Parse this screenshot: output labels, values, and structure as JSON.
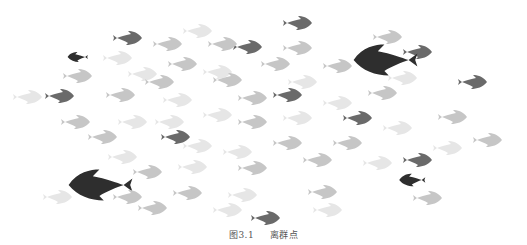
{
  "figure": {
    "caption_number": "图3.1",
    "caption_title": "离群点"
  },
  "colors": {
    "light": "#e6e6e6",
    "medium": "#c6c6c6",
    "dark": "#6a6a6a",
    "outlier": "#2e2e2e"
  },
  "fish": [
    {
      "x": 300,
      "y": 23,
      "s": 1,
      "c": "dark",
      "d": 1
    },
    {
      "x": 130,
      "y": 38,
      "s": 1,
      "c": "dark",
      "d": 1
    },
    {
      "x": 200,
      "y": 31,
      "s": 1,
      "c": "light",
      "d": 1
    },
    {
      "x": 390,
      "y": 37,
      "s": 1,
      "c": "medium",
      "d": 1
    },
    {
      "x": 250,
      "y": 47,
      "s": 1,
      "c": "dark",
      "d": 1
    },
    {
      "x": 225,
      "y": 44,
      "s": 1,
      "c": "medium",
      "d": 1
    },
    {
      "x": 300,
      "y": 48,
      "s": 1,
      "c": "medium",
      "d": 1
    },
    {
      "x": 420,
      "y": 52,
      "s": 1,
      "c": "dark",
      "d": 1
    },
    {
      "x": 76,
      "y": 57,
      "s": 0.7,
      "c": "outlier",
      "d": -1
    },
    {
      "x": 170,
      "y": 44,
      "s": 1,
      "c": "medium",
      "d": 1
    },
    {
      "x": 380,
      "y": 60,
      "s": 2.2,
      "c": "outlier",
      "d": -1
    },
    {
      "x": 120,
      "y": 58,
      "s": 1,
      "c": "light",
      "d": 1
    },
    {
      "x": 185,
      "y": 64,
      "s": 1,
      "c": "medium",
      "d": 1
    },
    {
      "x": 278,
      "y": 64,
      "s": 1,
      "c": "medium",
      "d": 1
    },
    {
      "x": 340,
      "y": 66,
      "s": 1,
      "c": "medium",
      "d": 1
    },
    {
      "x": 80,
      "y": 76,
      "s": 1,
      "c": "medium",
      "d": 1
    },
    {
      "x": 145,
      "y": 74,
      "s": 1,
      "c": "light",
      "d": 1
    },
    {
      "x": 220,
      "y": 72,
      "s": 1,
      "c": "light",
      "d": 1
    },
    {
      "x": 475,
      "y": 82,
      "s": 1,
      "c": "dark",
      "d": 1
    },
    {
      "x": 162,
      "y": 82,
      "s": 1,
      "c": "medium",
      "d": 1
    },
    {
      "x": 230,
      "y": 80,
      "s": 1,
      "c": "medium",
      "d": 1
    },
    {
      "x": 305,
      "y": 82,
      "s": 1,
      "c": "light",
      "d": 1
    },
    {
      "x": 405,
      "y": 78,
      "s": 1,
      "c": "light",
      "d": 1
    },
    {
      "x": 30,
      "y": 97,
      "s": 1,
      "c": "light",
      "d": 1
    },
    {
      "x": 62,
      "y": 96,
      "s": 1,
      "c": "dark",
      "d": 1
    },
    {
      "x": 123,
      "y": 95,
      "s": 1,
      "c": "medium",
      "d": 1
    },
    {
      "x": 180,
      "y": 100,
      "s": 1,
      "c": "light",
      "d": 1
    },
    {
      "x": 255,
      "y": 98,
      "s": 1,
      "c": "medium",
      "d": 1
    },
    {
      "x": 290,
      "y": 95,
      "s": 1,
      "c": "dark",
      "d": 1
    },
    {
      "x": 340,
      "y": 103,
      "s": 1,
      "c": "light",
      "d": 1
    },
    {
      "x": 385,
      "y": 93,
      "s": 1,
      "c": "medium",
      "d": 1
    },
    {
      "x": 220,
      "y": 115,
      "s": 1,
      "c": "light",
      "d": 1
    },
    {
      "x": 300,
      "y": 118,
      "s": 1,
      "c": "light",
      "d": 1
    },
    {
      "x": 360,
      "y": 118,
      "s": 1,
      "c": "dark",
      "d": 1
    },
    {
      "x": 455,
      "y": 117,
      "s": 1,
      "c": "medium",
      "d": 1
    },
    {
      "x": 78,
      "y": 122,
      "s": 1,
      "c": "medium",
      "d": 1
    },
    {
      "x": 135,
      "y": 122,
      "s": 1,
      "c": "light",
      "d": 1
    },
    {
      "x": 172,
      "y": 122,
      "s": 1,
      "c": "light",
      "d": 1
    },
    {
      "x": 255,
      "y": 122,
      "s": 1,
      "c": "medium",
      "d": 1
    },
    {
      "x": 400,
      "y": 128,
      "s": 1,
      "c": "light",
      "d": 1
    },
    {
      "x": 105,
      "y": 137,
      "s": 1,
      "c": "medium",
      "d": 1
    },
    {
      "x": 178,
      "y": 137,
      "s": 1,
      "c": "dark",
      "d": 1
    },
    {
      "x": 200,
      "y": 146,
      "s": 1,
      "c": "light",
      "d": 1
    },
    {
      "x": 290,
      "y": 143,
      "s": 1,
      "c": "medium",
      "d": 1
    },
    {
      "x": 350,
      "y": 143,
      "s": 1,
      "c": "medium",
      "d": 1
    },
    {
      "x": 450,
      "y": 148,
      "s": 1,
      "c": "light",
      "d": 1
    },
    {
      "x": 490,
      "y": 140,
      "s": 1,
      "c": "medium",
      "d": 1
    },
    {
      "x": 125,
      "y": 157,
      "s": 1,
      "c": "light",
      "d": 1
    },
    {
      "x": 240,
      "y": 152,
      "s": 1,
      "c": "light",
      "d": 1
    },
    {
      "x": 320,
      "y": 160,
      "s": 1,
      "c": "medium",
      "d": 1
    },
    {
      "x": 420,
      "y": 160,
      "s": 1,
      "c": "dark",
      "d": 1
    },
    {
      "x": 95,
      "y": 185,
      "s": 2.2,
      "c": "outlier",
      "d": -1
    },
    {
      "x": 150,
      "y": 172,
      "s": 1,
      "c": "medium",
      "d": 1
    },
    {
      "x": 195,
      "y": 167,
      "s": 1,
      "c": "light",
      "d": 1
    },
    {
      "x": 255,
      "y": 168,
      "s": 1,
      "c": "medium",
      "d": 1
    },
    {
      "x": 380,
      "y": 163,
      "s": 1,
      "c": "light",
      "d": 1
    },
    {
      "x": 410,
      "y": 180,
      "s": 0.9,
      "c": "outlier",
      "d": -1
    },
    {
      "x": 60,
      "y": 197,
      "s": 1,
      "c": "light",
      "d": 1
    },
    {
      "x": 130,
      "y": 197,
      "s": 1,
      "c": "medium",
      "d": 1
    },
    {
      "x": 190,
      "y": 193,
      "s": 1,
      "c": "medium",
      "d": 1
    },
    {
      "x": 245,
      "y": 195,
      "s": 1,
      "c": "light",
      "d": 1
    },
    {
      "x": 325,
      "y": 192,
      "s": 1,
      "c": "medium",
      "d": 1
    },
    {
      "x": 430,
      "y": 198,
      "s": 1,
      "c": "medium",
      "d": 1
    },
    {
      "x": 155,
      "y": 208,
      "s": 1,
      "c": "medium",
      "d": 1
    },
    {
      "x": 230,
      "y": 210,
      "s": 1,
      "c": "light",
      "d": 1
    },
    {
      "x": 268,
      "y": 218,
      "s": 1,
      "c": "dark",
      "d": 1
    },
    {
      "x": 330,
      "y": 210,
      "s": 1,
      "c": "light",
      "d": 1
    }
  ]
}
